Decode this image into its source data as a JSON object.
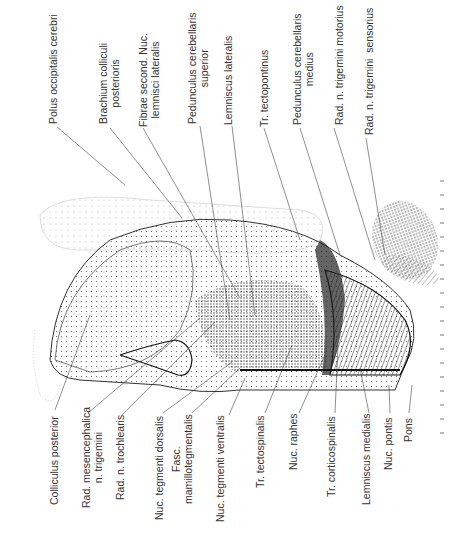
{
  "figure": {
    "top_labels": [
      {
        "id": "polus-occipitalis",
        "text": "Polus occipitalis cerebri",
        "x": 47,
        "y": 124
      },
      {
        "id": "brachium-colliculi",
        "text": "Brachium colliculi\nposterioris",
        "x": 97,
        "y": 124
      },
      {
        "id": "fibrae-second",
        "text": "Fibrae second. Nuc.\nlemnisci lateralis",
        "x": 137,
        "y": 127
      },
      {
        "id": "pedunculus-cerebellaris-superior",
        "text": "Pedunculus cerebellaris\nsuperior",
        "x": 186,
        "y": 124
      },
      {
        "id": "lemniscus-lateralis",
        "text": "Lemniscus lateralis",
        "x": 222,
        "y": 125
      },
      {
        "id": "tr-tectopontinus",
        "text": "Tr. tectopontinus",
        "x": 258,
        "y": 127
      },
      {
        "id": "pedunculus-cerebellaris-medius",
        "text": "Pedunculus cerebellaris\nmedius",
        "x": 291,
        "y": 125
      },
      {
        "id": "rad-trigemini-motorius",
        "text": "Rad. n. trigemini motorius",
        "x": 333,
        "y": 125
      },
      {
        "id": "rad-trigemini-sensorius",
        "text": "Rad. n. trigemini  sensorius",
        "x": 363,
        "y": 135
      }
    ],
    "bottom_labels": [
      {
        "id": "colliculus-posterior",
        "text": "Colliculus posterior",
        "x": 48,
        "y": 505
      },
      {
        "id": "rad-mesencephalica",
        "text": "Rad. mesencephalica\nn. trigemini",
        "x": 80,
        "y": 508
      },
      {
        "id": "rad-trochlearis",
        "text": "Rad. n. trochlearis",
        "x": 114,
        "y": 500
      },
      {
        "id": "nuc-tegmenti-dorsalis",
        "text": "Nuc. tegmenti dorsalis",
        "x": 153,
        "y": 520
      },
      {
        "id": "fasc-mamillotegmentalis",
        "text": "Fasc.\nmamillotegmentalis",
        "x": 170,
        "y": 504
      },
      {
        "id": "nuc-tegmenti-ventralis",
        "text": "Nuc. tegmenti ventralis",
        "x": 214,
        "y": 522
      },
      {
        "id": "tr-tectospinalis",
        "text": "Tr. tectospinalis",
        "x": 254,
        "y": 488
      },
      {
        "id": "nuc-raphes",
        "text": "Nuc. raphes",
        "x": 287,
        "y": 470
      },
      {
        "id": "tr-corticospinalis",
        "text": "Tr. corticospinalis",
        "x": 325,
        "y": 497
      },
      {
        "id": "lemniscus-medialis",
        "text": "Lemniscus medialis",
        "x": 360,
        "y": 505
      },
      {
        "id": "nuc-pontis",
        "text": "Nuc. pontis",
        "x": 382,
        "y": 470
      },
      {
        "id": "pons",
        "text": "Pons",
        "x": 402,
        "y": 442
      }
    ]
  }
}
